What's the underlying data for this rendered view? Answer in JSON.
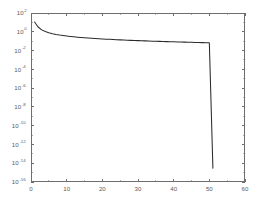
{
  "chart_data": {
    "type": "line",
    "title": "",
    "subtitle": "",
    "xlabel": "",
    "ylabel": "",
    "xscale": "linear",
    "yscale": "log",
    "xlim": [
      0,
      60
    ],
    "ylim": [
      1e-16,
      100
    ],
    "grid": false,
    "legend": null,
    "legend_position": "none",
    "x_ticks": [
      0,
      10,
      20,
      30,
      40,
      50,
      60
    ],
    "x_tick_labels": [
      "0",
      "10",
      "20",
      "30",
      "40",
      "50",
      "60"
    ],
    "y_ticks": [
      100,
      1,
      0.01,
      0.0001,
      1e-06,
      1e-08,
      1e-10,
      1e-12,
      1e-14,
      1e-16
    ],
    "y_tick_labels": [
      "10^2",
      "10^0",
      "10^-2",
      "10^-4",
      "10^-6",
      "10^-8",
      "10^-10",
      "10^-12",
      "10^-14",
      "10^-16"
    ],
    "y_tick_bases": [
      "10",
      "10",
      "10",
      "10",
      "10",
      "10",
      "10",
      "10",
      "10",
      "10"
    ],
    "y_tick_exponents": [
      "2",
      "0",
      "-2",
      "-4",
      "-6",
      "-8",
      "-10",
      "-12",
      "-14",
      "-16"
    ],
    "series": [
      {
        "name": "singular values",
        "color": "#2b2b2b",
        "x": [
          1,
          2,
          3,
          4,
          5,
          6,
          7,
          8,
          9,
          10,
          11,
          12,
          13,
          14,
          15,
          16,
          17,
          18,
          19,
          20,
          21,
          22,
          23,
          24,
          25,
          26,
          27,
          28,
          29,
          30,
          31,
          32,
          33,
          34,
          35,
          36,
          37,
          38,
          39,
          40,
          41,
          42,
          43,
          44,
          45,
          46,
          47,
          48,
          49,
          50,
          51
        ],
        "values": [
          11.0,
          3.2,
          1.6,
          1.05,
          0.78,
          0.62,
          0.52,
          0.45,
          0.4,
          0.355,
          0.32,
          0.292,
          0.268,
          0.248,
          0.231,
          0.216,
          0.203,
          0.191,
          0.181,
          0.172,
          0.163,
          0.156,
          0.149,
          0.143,
          0.137,
          0.132,
          0.127,
          0.122,
          0.118,
          0.114,
          0.11,
          0.107,
          0.104,
          0.1,
          0.0975,
          0.0948,
          0.0922,
          0.0897,
          0.0874,
          0.0851,
          0.083,
          0.0809,
          0.0789,
          0.077,
          0.0752,
          0.0734,
          0.0717,
          0.0701,
          0.0686,
          0.0672,
          3e-15
        ]
      }
    ],
    "annotations": []
  },
  "figure": {
    "background_color": "#ffffff",
    "axes_color": "#6e6e6e",
    "curve_color": "#2b2b2b",
    "plot_box": {
      "left": 31,
      "top": 13,
      "right": 245,
      "bottom": 182
    }
  }
}
